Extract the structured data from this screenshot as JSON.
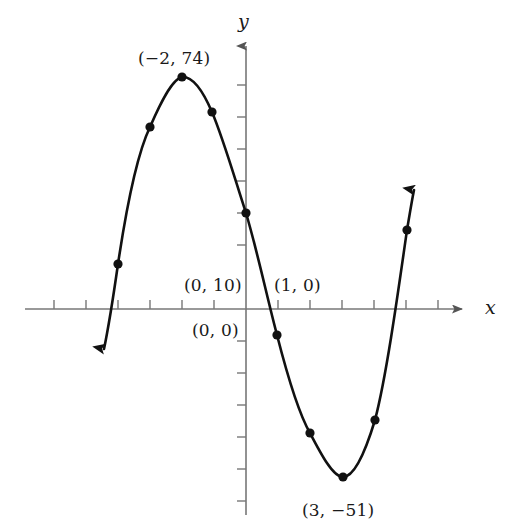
{
  "figure": {
    "background_color": "#ffffff",
    "curve_color": "#111111",
    "axis_color": "#777777",
    "label_color": "#1a1a1a"
  },
  "axes": {
    "x_axis_label": "x",
    "y_axis_label": "y",
    "x_axis_arrow": "right-arrowhead",
    "y_axis_arrow": "up-arrowhead",
    "origin_px": {
      "x": 246,
      "y": 309
    },
    "x_tick_spacing_px": 32,
    "y_tick_spacing_px": 32,
    "x_ticks_px": [
      54,
      86,
      118,
      150,
      182,
      214,
      278,
      310,
      342,
      374,
      406,
      438
    ],
    "y_ticks_px": [
      85,
      117,
      149,
      181,
      213,
      245,
      341,
      373,
      405,
      437,
      469,
      501
    ]
  },
  "labels": [
    {
      "id": "local-max-label",
      "text": "(−2, 74)",
      "x_px": 138,
      "y_px": 48
    },
    {
      "id": "y-intercept-label",
      "text": "(0, 10)",
      "x_px": 184,
      "y_px": 275
    },
    {
      "id": "origin-label",
      "text": "(0, 0)",
      "x_px": 192,
      "y_px": 320
    },
    {
      "id": "root-label",
      "text": "(1, 0)",
      "x_px": 274,
      "y_px": 275
    },
    {
      "id": "local-min-label",
      "text": "(3, −51)",
      "x_px": 302,
      "y_px": 500
    }
  ],
  "chart_data": {
    "type": "line",
    "title": "",
    "xlabel": "x",
    "ylabel": "y",
    "grid": false,
    "legend": null,
    "curve_description": "cubic polynomial with local maximum at (-2, 74), y-intercept (0, 10), root at (1, 0), and local minimum at (3, -51)",
    "annotated_points": [
      {
        "label": "(−2, 74)",
        "x": -2,
        "y": 74
      },
      {
        "label": "(0, 10)",
        "x": 0,
        "y": 10
      },
      {
        "label": "(1, 0)",
        "x": 1,
        "y": 0
      },
      {
        "label": "(0, 0)",
        "x": 0,
        "y": 0
      },
      {
        "label": "(3, −51)",
        "x": 3,
        "y": -51
      }
    ],
    "marker_points_px": [
      {
        "x": 118,
        "y": 264
      },
      {
        "x": 150,
        "y": 127
      },
      {
        "x": 182,
        "y": 77
      },
      {
        "x": 212,
        "y": 112
      },
      {
        "x": 246,
        "y": 213
      },
      {
        "x": 277,
        "y": 335
      },
      {
        "x": 310,
        "y": 433
      },
      {
        "x": 343,
        "y": 477
      },
      {
        "x": 375,
        "y": 420
      },
      {
        "x": 407,
        "y": 230
      }
    ],
    "curve_path_px": "M 104,349 C 110,320 114,292 118,264 C 128,197 138,152 150,127 C 160,104 172,79 182,77 C 193,76 203,91 212,112 C 223,138 234,176 246,213 C 257,250 267,297 277,335 C 288,378 299,414 310,433 C 321,454 333,477 343,477 C 354,477 365,453 375,420 C 386,378 397,300 407,230 C 410,212 412,200 414,190",
    "curve_endpoints": {
      "left_end_px": {
        "x": 104,
        "y": 349
      },
      "left_arrow": "down-left-arrowhead",
      "right_end_px": {
        "x": 414,
        "y": 190
      },
      "right_arrow": "up-right-arrowhead"
    },
    "xlim_px": [
      25,
      470
    ],
    "ylim_px": [
      20,
      515
    ]
  }
}
